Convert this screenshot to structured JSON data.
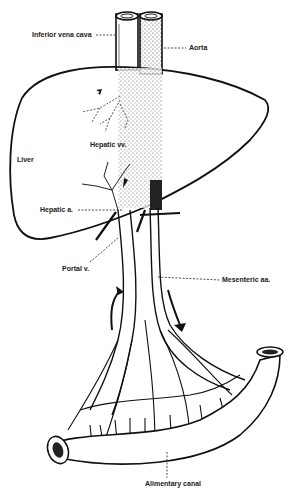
{
  "figure": {
    "labels": {
      "ivc": "Inferior vena cava",
      "aorta": "Aorta",
      "hepatic_vv": "Hepatic vv.",
      "liver": "Liver",
      "hepatic_a": "Hepatic a.",
      "portal_v": "Portal v.",
      "mesenteric": "Mesenteric aa.",
      "alimentary": "Alimentary canal"
    },
    "colors": {
      "ink": "#1a1a1a",
      "paper": "#ffffff"
    }
  }
}
